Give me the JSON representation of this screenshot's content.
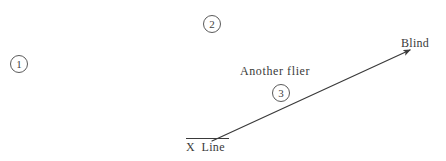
{
  "canvas": {
    "width": 446,
    "height": 161,
    "background_color": "#ffffff",
    "ink_color": "#3a3a3a"
  },
  "annotations": {
    "markers": [
      {
        "id": "1",
        "label": "1",
        "x": 19,
        "y": 64
      },
      {
        "id": "2",
        "label": "2",
        "x": 212,
        "y": 24
      },
      {
        "id": "3",
        "label": "3",
        "x": 281,
        "y": 93
      }
    ],
    "labels": {
      "blind": "Blind",
      "another_flier": "Another flier",
      "baseline": "X  Line"
    }
  },
  "diagram_data": {
    "type": "line-diagram",
    "description": "Hand-drawn style flight-path sketch: an arrow rises from the X Line baseline toward the Blind at upper right.",
    "baseline": {
      "name": "X Line",
      "rule_x_start": 186,
      "rule_x_end": 229,
      "rule_y": 141
    },
    "arrow": {
      "name": "flight-path",
      "from": {
        "x": 212,
        "y": 141
      },
      "to": {
        "x": 414,
        "y": 48
      },
      "has_arrowhead": true,
      "arrowhead_at": "to",
      "stroke_color": "#3a3a3a",
      "stroke_width": 1.2
    }
  }
}
